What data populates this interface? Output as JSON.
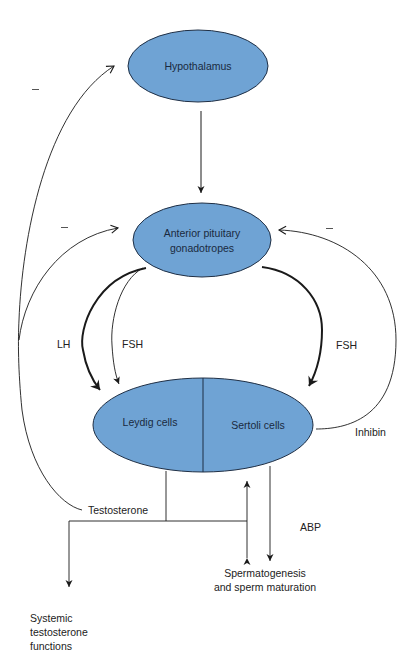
{
  "diagram": {
    "colors": {
      "node_fill": "#6fa3d4",
      "node_stroke": "#1f2f45",
      "line": "#1a1a1a"
    },
    "nodes": {
      "hypothalamus": {
        "label": "Hypothalamus"
      },
      "pituitary": {
        "line1": "Anterior pituitary",
        "line2": "gonadotropes"
      },
      "leydig": {
        "label": "Leydig cells"
      },
      "sertoli": {
        "label": "Sertoli cells"
      }
    },
    "edge_labels": {
      "lh": "LH",
      "fsh_left": "FSH",
      "fsh_right": "FSH",
      "inhibin": "Inhibin",
      "testosterone": "Testosterone",
      "abp": "ABP"
    },
    "feedback_signs": {
      "hypothalamus_neg": "–",
      "pituitary_left_neg": "–",
      "pituitary_right_neg": "–"
    },
    "outputs": {
      "spermatogenesis": {
        "line1": "Spermatogenesis",
        "line2": "and sperm maturation"
      },
      "systemic": {
        "line1": "Systemic",
        "line2": "testosterone",
        "line3": "functions"
      }
    }
  }
}
